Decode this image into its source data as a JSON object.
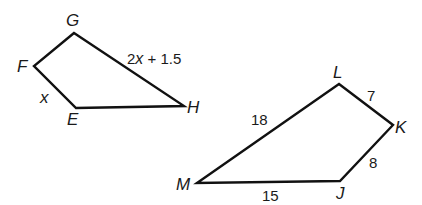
{
  "figures": [
    {
      "name": "EFGH",
      "vertices": {
        "G": {
          "label": "G",
          "x": 74,
          "y": 33
        },
        "F": {
          "label": "F",
          "x": 34,
          "y": 66
        },
        "E": {
          "label": "E",
          "x": 76,
          "y": 108
        },
        "H": {
          "label": "H",
          "x": 184,
          "y": 106
        }
      },
      "side_labels": {
        "EF": "x",
        "GH_var": "x",
        "GH_prefix": "2",
        "GH_suffix": " + 1.5"
      }
    },
    {
      "name": "JKLM",
      "vertices": {
        "L": {
          "label": "L",
          "x": 339,
          "y": 84
        },
        "K": {
          "label": "K",
          "x": 393,
          "y": 125
        },
        "J": {
          "label": "J",
          "x": 340,
          "y": 181
        },
        "M": {
          "label": "M",
          "x": 197,
          "y": 183
        }
      },
      "side_labels": {
        "LM": "18",
        "LK": "7",
        "KJ": "8",
        "MJ": "15"
      }
    }
  ]
}
